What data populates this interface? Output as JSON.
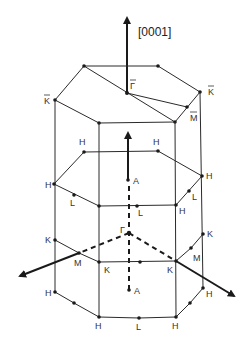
{
  "diagram": {
    "axis_label": "[0001]",
    "surface_zone_labels": {
      "gamma_bar": "Γ",
      "k_bar_left": "K",
      "k_bar_right": "K",
      "m_bar": "M"
    },
    "bulk_zone_labels": {
      "h_top_left": "H",
      "h_top_right": "H",
      "h_mid_left": "H",
      "h_mid_right": "H",
      "h_mid_front_right": "H",
      "l_mid_left": "L",
      "l_mid_front": "L",
      "l_mid_right": "L",
      "a_top": "A",
      "gamma": "Γ",
      "k_left": "K",
      "m_left": "M",
      "k_front_left": "K",
      "k_front_right": "K",
      "m_right": "M",
      "k_right": "K",
      "a_bottom": "A",
      "h_bottom_left": "H",
      "h_bottom_front_left": "H",
      "l_bottom": "L",
      "h_bottom_front_right": "H",
      "h_bottom_right": "H"
    }
  }
}
